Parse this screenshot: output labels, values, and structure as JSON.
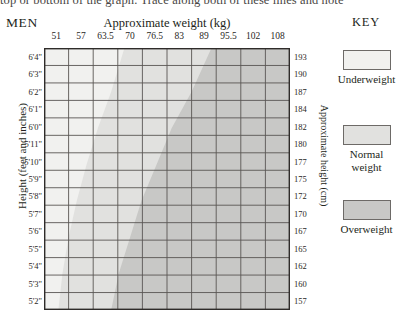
{
  "page": {
    "cut_off_text": "top or bottom of the graph. Trace along both of these lines and note"
  },
  "header": {
    "gender_label": "MEN",
    "weight_axis_title": "Approximate weight (kg)",
    "key_title": "KEY"
  },
  "axes": {
    "height_axis_title_left": "Height (feet and inches)",
    "height_axis_title_right": "Approximate height (cm)"
  },
  "legend": {
    "items": [
      {
        "label_line1": "Underweight",
        "label_line2": "",
        "color": "#f1f1ef"
      },
      {
        "label_line1": "Normal",
        "label_line2": "weight",
        "color": "#e1e1df"
      },
      {
        "label_line1": "Overweight",
        "label_line2": "",
        "color": "#c8c8c6"
      }
    ]
  },
  "chart_data": {
    "type": "heatmap",
    "title": "Approximate weight (kg)",
    "subtitle": "MEN",
    "xlabel": "Approximate weight (kg)",
    "ylabel": "Height (feet and inches)",
    "y2label": "Approximate height (cm)",
    "grid": true,
    "legend_position": "right",
    "x_ticks": [
      "51",
      "57",
      "63.5",
      "70",
      "76.5",
      "83",
      "89",
      "95.5",
      "102",
      "108"
    ],
    "x_tick_values": [
      51,
      57,
      63.5,
      70,
      76.5,
      83,
      89,
      95.5,
      102,
      108
    ],
    "xlim": [
      48,
      111
    ],
    "y_ticks_feet": [
      "6'4\"",
      "6'3\"",
      "6'2\"",
      "6'1\"",
      "6'0\"",
      "5'11\"",
      "5'10\"",
      "5'9\"",
      "5'8\"",
      "5'7\"",
      "5'6\"",
      "5'5\"",
      "5'4\"",
      "5'3\"",
      "5'2\""
    ],
    "y_ticks_cm": [
      "193",
      "190",
      "187",
      "184",
      "182",
      "180",
      "177",
      "175",
      "172",
      "170",
      "167",
      "165",
      "162",
      "160",
      "157"
    ],
    "y_tick_values_cm": [
      193,
      190,
      187,
      184,
      182,
      180,
      177,
      175,
      172,
      170,
      167,
      165,
      162,
      160,
      157
    ],
    "ylim_cm": [
      157,
      193
    ],
    "columns": 10,
    "rows": 15,
    "bands": [
      {
        "name": "Underweight",
        "color": "#f1f1ef",
        "boundary_description": "left of lower BMI boundary",
        "boundary_points": [
          {
            "cm": 193,
            "kg": 68.5
          },
          {
            "cm": 187,
            "kg": 65.0
          },
          {
            "cm": 182,
            "kg": 61.5
          },
          {
            "cm": 177,
            "kg": 58.5
          },
          {
            "cm": 172,
            "kg": 56.0
          },
          {
            "cm": 167,
            "kg": 54.0
          },
          {
            "cm": 162,
            "kg": 52.5
          },
          {
            "cm": 157,
            "kg": 51.5
          }
        ]
      },
      {
        "name": "Normal weight",
        "color": "#e1e1df",
        "boundary_description": "between lower and upper BMI boundaries",
        "boundary_points": [
          {
            "cm": 193,
            "kg": 91.0
          },
          {
            "cm": 187,
            "kg": 86.0
          },
          {
            "cm": 182,
            "kg": 81.0
          },
          {
            "cm": 177,
            "kg": 77.0
          },
          {
            "cm": 172,
            "kg": 73.0
          },
          {
            "cm": 167,
            "kg": 70.0
          },
          {
            "cm": 162,
            "kg": 67.0
          },
          {
            "cm": 157,
            "kg": 65.0
          }
        ]
      },
      {
        "name": "Overweight",
        "color": "#c8c8c6",
        "boundary_description": "right of upper BMI boundary"
      }
    ]
  }
}
